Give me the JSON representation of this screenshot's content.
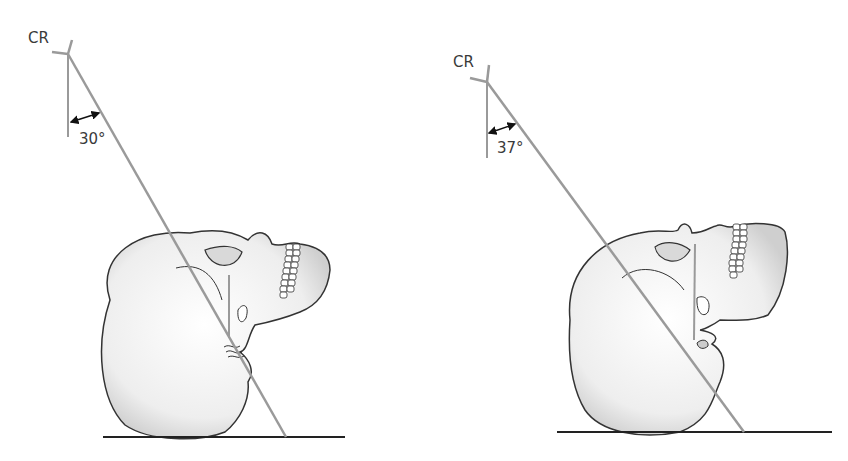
{
  "figures": [
    {
      "cr_label": "CR",
      "angle_label": "30°"
    },
    {
      "cr_label": "CR",
      "angle_label": "37°"
    }
  ],
  "colors": {
    "ray": "#9a9a9a",
    "outline": "#333333",
    "skull_fill": "#f2f2f2",
    "baseline": "#222222"
  }
}
